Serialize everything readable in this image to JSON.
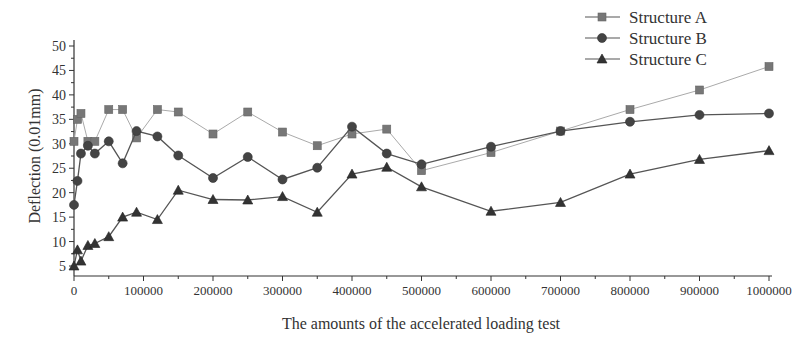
{
  "chart_data": {
    "type": "line",
    "title": "",
    "xlabel": "The amounts of the accelerated loading test",
    "ylabel": "Deflection (0.01mm)",
    "xlim": [
      0,
      1000000
    ],
    "ylim": [
      5,
      50
    ],
    "x_ticks": [
      0,
      100000,
      200000,
      300000,
      400000,
      500000,
      600000,
      700000,
      800000,
      900000,
      1000000
    ],
    "y_ticks": [
      5,
      10,
      15,
      20,
      25,
      30,
      35,
      40,
      45,
      50
    ],
    "grid": false,
    "legend_position": "top-right",
    "x": [
      0,
      5000,
      10000,
      20000,
      30000,
      50000,
      70000,
      90000,
      120000,
      150000,
      200000,
      250000,
      300000,
      350000,
      400000,
      450000,
      500000,
      600000,
      700000,
      800000,
      900000,
      1000000
    ],
    "series": [
      {
        "name": "Structure A",
        "marker": "square",
        "color": "#777777",
        "values": [
          30.5,
          35,
          36.2,
          30.5,
          30.5,
          37,
          37,
          31.2,
          37,
          36.5,
          32,
          36.5,
          32.4,
          29.6,
          32,
          33,
          24.5,
          28.2,
          32.6,
          37,
          41,
          45.8
        ]
      },
      {
        "name": "Structure B",
        "marker": "circle",
        "color": "#444444",
        "values": [
          17.5,
          22.4,
          28,
          29.6,
          28,
          30.5,
          26,
          32.6,
          31.5,
          27.6,
          23,
          27.3,
          22.7,
          25.1,
          33.5,
          28,
          25.8,
          29.4,
          32.6,
          34.5,
          35.9,
          36.2
        ]
      },
      {
        "name": "Structure C",
        "marker": "triangle",
        "color": "#333333",
        "values": [
          5,
          8.3,
          6,
          9.2,
          9.6,
          11,
          15,
          16,
          14.5,
          20.5,
          18.6,
          18.5,
          19.2,
          16,
          23.8,
          25.2,
          21.2,
          16.2,
          18,
          23.8,
          26.8,
          28.6
        ]
      }
    ]
  }
}
